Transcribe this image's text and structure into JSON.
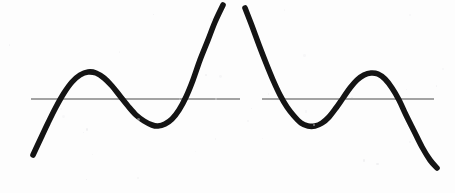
{
  "figure": {
    "background_color": "#fdfdfd",
    "curve_color": "#141414",
    "axis_color": "#4a4a4a",
    "curve_stroke_width": 5.6,
    "axis_stroke_width": 1.1,
    "width": 455,
    "height": 193
  },
  "chart_data": {
    "type": "line",
    "xlabel": "",
    "ylabel": "",
    "grid": false,
    "legend": null,
    "xlim": [
      0,
      455
    ],
    "ylim": [
      193,
      0
    ],
    "annotations": [
      {
        "name": "vertical-asymptote-gap",
        "x_start": 225,
        "x_end": 245,
        "label": "vertical asymptote"
      }
    ],
    "series": [
      {
        "name": "left-branch",
        "comment": "Rises from lower left, local maximum, local minimum, then diverges upward to the asymptote",
        "points": [
          [
            33,
            155
          ],
          [
            40,
            140
          ],
          [
            48,
            123
          ],
          [
            56,
            107
          ],
          [
            64,
            93
          ],
          [
            72,
            82
          ],
          [
            80,
            75
          ],
          [
            88,
            72
          ],
          [
            96,
            73
          ],
          [
            104,
            78
          ],
          [
            112,
            86
          ],
          [
            120,
            96
          ],
          [
            128,
            106
          ],
          [
            136,
            115
          ],
          [
            144,
            121
          ],
          [
            152,
            125
          ],
          [
            158,
            126
          ],
          [
            165,
            124
          ],
          [
            172,
            119
          ],
          [
            179,
            110
          ],
          [
            186,
            97
          ],
          [
            193,
            80
          ],
          [
            200,
            60
          ],
          [
            208,
            40
          ],
          [
            215,
            22
          ],
          [
            223,
            5
          ]
        ],
        "features": {
          "local_maximum": [
            88,
            72
          ],
          "local_minimum": [
            156,
            126
          ],
          "axis_crossings": [
            [
              58,
              99
            ],
            [
              116,
              99
            ],
            [
              185,
              99
            ]
          ],
          "start_point": [
            33,
            155
          ],
          "end_point": [
            223,
            5
          ]
        }
      },
      {
        "name": "right-branch",
        "comment": "Descends from the asymptote, local minimum, local maximum, then falls to lower right",
        "points": [
          [
            245,
            8
          ],
          [
            252,
            26
          ],
          [
            259,
            45
          ],
          [
            266,
            63
          ],
          [
            273,
            80
          ],
          [
            280,
            95
          ],
          [
            287,
            107
          ],
          [
            294,
            116
          ],
          [
            301,
            123
          ],
          [
            308,
            126
          ],
          [
            315,
            126
          ],
          [
            322,
            123
          ],
          [
            329,
            117
          ],
          [
            336,
            108
          ],
          [
            343,
            98
          ],
          [
            350,
            88
          ],
          [
            357,
            80
          ],
          [
            364,
            75
          ],
          [
            371,
            73
          ],
          [
            378,
            74
          ],
          [
            385,
            79
          ],
          [
            392,
            88
          ],
          [
            399,
            100
          ],
          [
            406,
            115
          ],
          [
            414,
            131
          ],
          [
            422,
            147
          ],
          [
            430,
            160
          ],
          [
            437,
            168
          ]
        ],
        "features": {
          "local_minimum": [
            311,
            126
          ],
          "local_maximum": [
            372,
            73
          ],
          "axis_crossings": [
            [
              268,
              99
            ],
            [
              345,
              99
            ],
            [
              398,
              99
            ]
          ],
          "start_point": [
            245,
            8
          ],
          "end_point": [
            437,
            168
          ]
        }
      }
    ],
    "reference_lines": [
      {
        "name": "horizontal-asymptote-left",
        "orientation": "horizontal",
        "y": 99,
        "x_start": 31,
        "x_end": 240
      },
      {
        "name": "horizontal-asymptote-right",
        "orientation": "horizontal",
        "y": 99,
        "x_start": 262,
        "x_end": 434
      }
    ]
  }
}
